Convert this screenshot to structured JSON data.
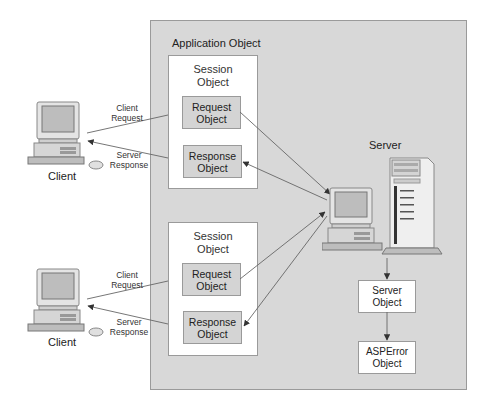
{
  "diagram": {
    "colors": {
      "application_panel": "#d8d8d8",
      "session_box": "#ffffff",
      "request_response_box": "#d4d4d4",
      "server_objects_box": "#ffffff",
      "border": "#9a9a9a",
      "arrow": "#555555"
    },
    "application": {
      "label": "Application Object"
    },
    "sessions": [
      {
        "label_line1": "Session",
        "label_line2": "Object",
        "request": {
          "line1": "Request",
          "line2": "Object"
        },
        "response": {
          "line1": "Response",
          "line2": "Object"
        }
      },
      {
        "label_line1": "Session",
        "label_line2": "Object",
        "request": {
          "line1": "Request",
          "line2": "Object"
        },
        "response": {
          "line1": "Response",
          "line2": "Object"
        }
      }
    ],
    "clients": [
      {
        "label": "Client",
        "request_label_line1": "Client",
        "request_label_line2": "Request",
        "response_label_line1": "Server",
        "response_label_line2": "Response"
      },
      {
        "label": "Client",
        "request_label_line1": "Client",
        "request_label_line2": "Request",
        "response_label_line1": "Server",
        "response_label_line2": "Response"
      }
    ],
    "server": {
      "label": "Server",
      "icon": "server-computer-icon"
    },
    "server_object": {
      "line1": "Server",
      "line2": "Object"
    },
    "asperror_object": {
      "line1": "ASPError",
      "line2": "Object"
    },
    "edges": [
      {
        "from": "client-1",
        "to": "session-1",
        "label": "Client Request"
      },
      {
        "from": "session-1",
        "to": "client-1",
        "label": "Server Response"
      },
      {
        "from": "request-1",
        "to": "server"
      },
      {
        "from": "server",
        "to": "response-1"
      },
      {
        "from": "client-2",
        "to": "session-2",
        "label": "Client Request"
      },
      {
        "from": "session-2",
        "to": "client-2",
        "label": "Server Response"
      },
      {
        "from": "request-2",
        "to": "server"
      },
      {
        "from": "server",
        "to": "response-2"
      },
      {
        "from": "server",
        "to": "server-object"
      },
      {
        "from": "server-object",
        "to": "asperror-object"
      }
    ]
  }
}
